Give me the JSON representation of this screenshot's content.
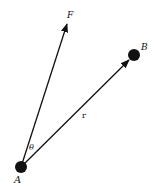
{
  "diagram": {
    "title": "",
    "points": {
      "A": {
        "label": "A",
        "x": 21,
        "y": 167,
        "radius": 6
      },
      "B": {
        "label": "B",
        "x": 134,
        "y": 55,
        "radius": 6
      }
    },
    "vectors": {
      "F": {
        "label": "F",
        "from": "A",
        "tip_x": 68,
        "tip_y": 22
      },
      "r": {
        "label": "r",
        "from": "A",
        "to": "B"
      }
    },
    "angle": {
      "label": "θ",
      "between": [
        "F",
        "r"
      ]
    },
    "colors": {
      "ink": "#111111",
      "background": "#ffffff"
    }
  }
}
